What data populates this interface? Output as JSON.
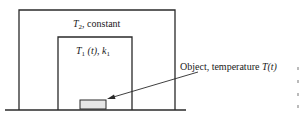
{
  "diagram": {
    "outer_region": {
      "label_var": "T",
      "label_sub": "2",
      "label_rest": ", constant"
    },
    "inner_region": {
      "label_var": "T",
      "label_sub": "1",
      "label_arg": " (t), ",
      "label_k": "k",
      "label_ksub": "1"
    },
    "object": {
      "label_text": "Object, temperature ",
      "label_var": "T",
      "label_arg": "(t)"
    },
    "colors": {
      "line": "#2a2a2a",
      "object_fill": "#e6e6e6",
      "edge_gray": "#bbbbbb"
    }
  }
}
